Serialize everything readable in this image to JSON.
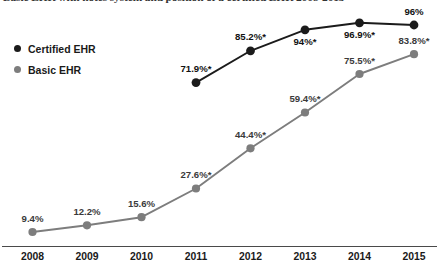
{
  "chart_data": {
    "type": "line",
    "title": "Basic EHR with notes system and position of a certified EHR 2008-2015",
    "xlabel": "",
    "ylabel": "",
    "grid": false,
    "legend_position": "top-left",
    "ylim": [
      0,
      100
    ],
    "categories": [
      "2008",
      "2009",
      "2010",
      "2011",
      "2012",
      "2013",
      "2014",
      "2015"
    ],
    "series": [
      {
        "name": "Certified EHR",
        "color": "#1b1b1b",
        "values": [
          null,
          null,
          null,
          71.9,
          85.2,
          94.0,
          96.9,
          96.0
        ],
        "labels": [
          "",
          "",
          "",
          "71.9%*",
          "85.2%*",
          "94%*",
          "96.9%*",
          "96%"
        ],
        "label_position": [
          "",
          "",
          "",
          "above",
          "above",
          "below",
          "below",
          "above"
        ]
      },
      {
        "name": "Basic EHR",
        "color": "#7d7d7d",
        "values": [
          9.4,
          12.2,
          15.6,
          27.6,
          44.4,
          59.4,
          75.5,
          83.8
        ],
        "labels": [
          "9.4%",
          "12.2%",
          "15.6%",
          "27.6%*",
          "44.4%*",
          "59.4%*",
          "75.5%*",
          "83.8%*"
        ],
        "label_position": [
          "above",
          "above",
          "above",
          "above",
          "above",
          "above",
          "above",
          "above"
        ]
      }
    ]
  },
  "legend": {
    "items": [
      {
        "label": "Certified EHR",
        "color": "#1b1b1b"
      },
      {
        "label": "Basic EHR",
        "color": "#7d7d7d"
      }
    ]
  },
  "axis": {
    "x_ticks": [
      "2008",
      "2009",
      "2010",
      "2011",
      "2012",
      "2013",
      "2014",
      "2015"
    ]
  }
}
